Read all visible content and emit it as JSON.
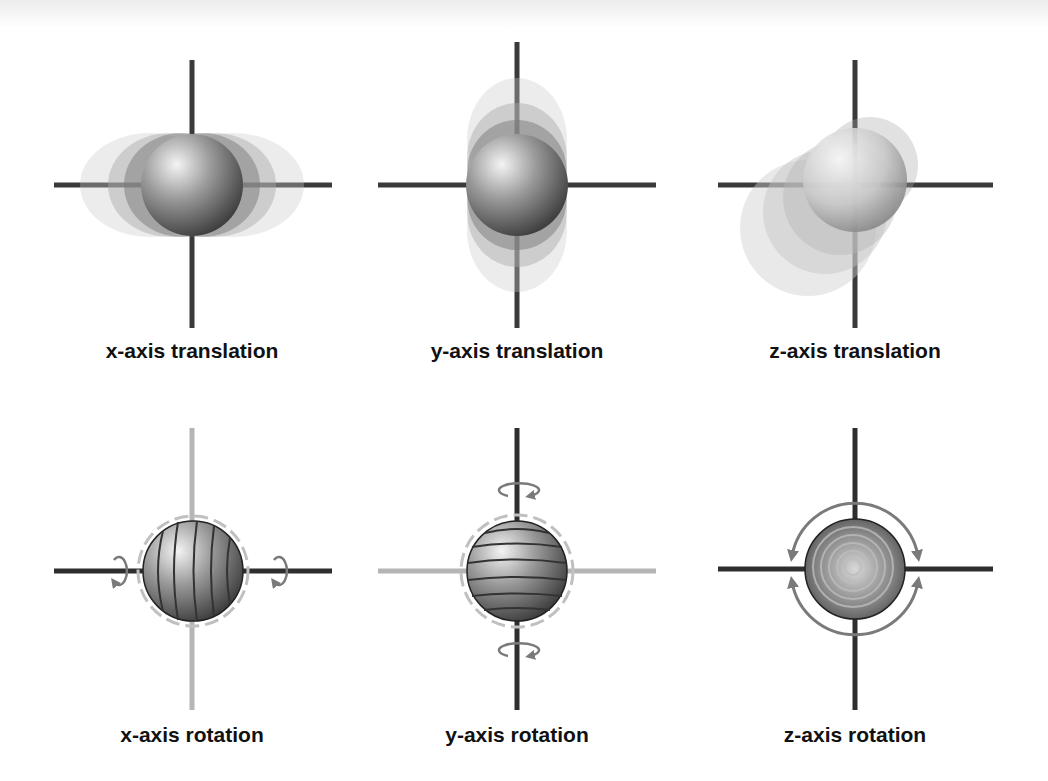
{
  "figure": {
    "panels": [
      {
        "id": "x-translation",
        "label": "x-axis translation",
        "motion": "translation",
        "axis": "x"
      },
      {
        "id": "y-translation",
        "label": "y-axis translation",
        "motion": "translation",
        "axis": "y"
      },
      {
        "id": "z-translation",
        "label": "z-axis translation",
        "motion": "translation",
        "axis": "z"
      },
      {
        "id": "x-rotation",
        "label": "x-axis rotation",
        "motion": "rotation",
        "axis": "x"
      },
      {
        "id": "y-rotation",
        "label": "y-axis rotation",
        "motion": "rotation",
        "axis": "y"
      },
      {
        "id": "z-rotation",
        "label": "z-axis rotation",
        "motion": "rotation",
        "axis": "z"
      }
    ],
    "colors": {
      "axis_dark": "#333333",
      "axis_light": "#b5b5b5",
      "arrow": "#7a7a7a",
      "sphere_light": "#f2f2f2",
      "sphere_dark": "#3a3a3a"
    }
  }
}
